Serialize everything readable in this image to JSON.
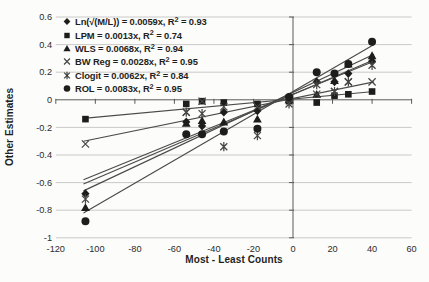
{
  "chart_data": {
    "type": "scatter",
    "title": "",
    "xlabel": "Most - Least Counts",
    "ylabel": "Other Estimates",
    "xlim": [
      -120,
      60
    ],
    "ylim": [
      -1,
      0.6
    ],
    "grid": "horizontal",
    "legend_position": "top-left-inside",
    "x_ticks": [
      -120,
      -100,
      -80,
      -60,
      -40,
      -20,
      0,
      20,
      40,
      60
    ],
    "x_tick_labels": [
      "-120",
      "-100",
      "-80",
      "-60",
      "-40",
      "-20",
      "0",
      "20",
      "40",
      "60"
    ],
    "y_ticks": [
      0.6,
      0.4,
      0.2,
      0,
      -0.2,
      -0.4,
      -0.6,
      -0.8,
      -1
    ],
    "y_tick_labels": [
      "0.6",
      "0.4",
      "0.2",
      "0",
      "-0.2",
      "-0.4",
      "-0.6",
      "-0.8",
      "-1"
    ],
    "x": [
      -105,
      -54,
      -46,
      -35,
      -18,
      -2,
      12,
      21,
      28,
      40
    ],
    "series": [
      {
        "name": "Ln(sqrt(M/L))",
        "legend_label": "Ln(√(M/L)) = 0.0059x, R² = 0.93",
        "marker": "diamond",
        "slope": 0.0059,
        "r2": 0.93,
        "values": [
          -0.68,
          -0.16,
          -0.19,
          -0.09,
          -0.08,
          0.02,
          0.13,
          0.13,
          0.19,
          0.28
        ],
        "trendline": {
          "x1": -106,
          "y1": -0.58,
          "x2": 41,
          "y2": 0.28
        }
      },
      {
        "name": "LPM",
        "legend_label": "LPM = 0.0013x, R² = 0.74",
        "marker": "square",
        "slope": 0.0013,
        "r2": 0.74,
        "values": [
          -0.14,
          -0.03,
          -0.01,
          -0.02,
          -0.03,
          -0.01,
          -0.02,
          0.03,
          0.04,
          0.06
        ],
        "trendline": {
          "x1": -106,
          "y1": -0.135,
          "x2": 41,
          "y2": 0.06
        }
      },
      {
        "name": "WLS",
        "legend_label": "WLS = 0.0068x, R² = 0.94",
        "marker": "triangle",
        "slope": 0.0068,
        "r2": 0.94,
        "values": [
          -0.78,
          -0.17,
          -0.15,
          -0.16,
          -0.14,
          0,
          0.04,
          0.14,
          0.26,
          0.32
        ],
        "trendline": {
          "x1": -106,
          "y1": -0.66,
          "x2": 41,
          "y2": 0.33
        }
      },
      {
        "name": "BW Reg",
        "legend_label": "BW Reg = 0.0028x, R² = 0.95",
        "marker": "x",
        "slope": 0.0028,
        "r2": 0.95,
        "values": [
          -0.32,
          -0.09,
          -0.01,
          -0.05,
          -0.05,
          0.01,
          0.04,
          0.06,
          0.13,
          0.13
        ],
        "trendline": {
          "x1": -106,
          "y1": -0.3,
          "x2": 41,
          "y2": 0.13
        }
      },
      {
        "name": "Clogit",
        "legend_label": "Clogit = 0.0062x, R² = 0.84",
        "marker": "asterisk",
        "slope": 0.0062,
        "r2": 0.84,
        "values": [
          -0.72,
          -0.09,
          -0.1,
          -0.34,
          -0.26,
          -0.03,
          0.11,
          0.06,
          0.13,
          0.25
        ],
        "trendline": {
          "x1": -106,
          "y1": -0.61,
          "x2": 41,
          "y2": 0.29
        }
      },
      {
        "name": "ROL",
        "legend_label": "ROL = 0.0083x, R² = 0.95",
        "marker": "circle",
        "slope": 0.0083,
        "r2": 0.95,
        "values": [
          -0.88,
          -0.25,
          -0.25,
          -0.23,
          -0.21,
          0.02,
          0.2,
          0.19,
          0.26,
          0.42
        ],
        "trendline": {
          "x1": -106,
          "y1": -0.82,
          "x2": 41,
          "y2": 0.4
        }
      }
    ],
    "colors": {
      "marker": "#1d1d1c",
      "stroke_marker": "#454543",
      "line": "#4a4a48",
      "grid": "#bdbdbb",
      "axis": "#5a5a58",
      "text": "#2b2b2b"
    }
  }
}
